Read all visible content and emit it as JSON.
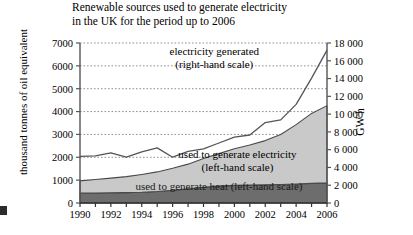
{
  "chart_data": {
    "type": "area",
    "title": "Renewable sources used to generate electricity\nin the UK for the period up to 2006",
    "xlabel": "",
    "ylabel": "thousand tonnes of oil equivalent",
    "ylabel_right": "GW h",
    "grid": true,
    "legend": "inline-annotations",
    "x": [
      1990,
      1991,
      1992,
      1993,
      1994,
      1995,
      1996,
      1997,
      1998,
      1999,
      2000,
      2001,
      2002,
      2003,
      2004,
      2005,
      2006
    ],
    "xlim": [
      1990,
      2006
    ],
    "xticks": [
      1990,
      1991,
      1992,
      1993,
      1994,
      1995,
      1996,
      1997,
      1998,
      1999,
      2000,
      2001,
      2002,
      2003,
      2004,
      2005,
      2006
    ],
    "xtick_labels": [
      "1990",
      "",
      "1992",
      "",
      "1994",
      "",
      "1996",
      "",
      "1998",
      "",
      "2000",
      "",
      "2002",
      "",
      "2004",
      "",
      "2006"
    ],
    "ylim": [
      0,
      7000
    ],
    "yticks": [
      0,
      1000,
      2000,
      3000,
      4000,
      5000,
      6000,
      7000
    ],
    "ytick_labels": [
      "0",
      "1000",
      "2000",
      "3000",
      "4000",
      "5000",
      "6000",
      "7000"
    ],
    "ylim_right": [
      0,
      18000
    ],
    "yticks_right": [
      0,
      2000,
      4000,
      6000,
      8000,
      10000,
      12000,
      14000,
      16000,
      18000
    ],
    "ytick_labels_right": [
      "0",
      "2 000",
      "4 000",
      "6 000",
      "8 000",
      "10 000",
      "12 000",
      "14 000",
      "16 000",
      "18 000"
    ],
    "series": [
      {
        "name": "used to generate heat (left-hand scale)",
        "axis": "left",
        "style": "stacked-area",
        "color": "#6d6d6d",
        "values": [
          430,
          440,
          450,
          455,
          470,
          500,
          560,
          620,
          690,
          740,
          770,
          790,
          800,
          810,
          830,
          860,
          880
        ]
      },
      {
        "name": "used to generate electricity (left-hand scale)",
        "axis": "left",
        "style": "stacked-area",
        "color": "#c9c9c9",
        "values": [
          540,
          590,
          640,
          700,
          780,
          860,
          960,
          1080,
          1260,
          1420,
          1600,
          1750,
          1930,
          2190,
          2600,
          3060,
          3380
        ]
      },
      {
        "name": "electricity generated (right-hand scale)",
        "axis": "right",
        "style": "line",
        "color": "#555555",
        "values": [
          5250,
          5300,
          5650,
          5150,
          5750,
          6200,
          5150,
          5800,
          6100,
          6750,
          7400,
          7650,
          9050,
          9350,
          11100,
          14050,
          17200
        ]
      }
    ],
    "annotations": [
      {
        "text": "electricity generated\n(right-hand scale)",
        "x": 1998.7,
        "y_right": 16600
      },
      {
        "text": "used to generate electricity\n(left-hand scale)",
        "x": 2000.2,
        "y_left": 1950
      },
      {
        "text": "used to generate heat (left-hand scale)",
        "x": 1999.0,
        "y_left": 560
      }
    ]
  },
  "labels": {
    "annotation_electricity_generated_line1": "electricity generated",
    "annotation_electricity_generated_line2": "(right-hand scale)",
    "annotation_used_electricity_line1": "used to generate electricity",
    "annotation_used_electricity_line2": "(left-hand scale)",
    "annotation_used_heat": "used to generate heat (left-hand scale)"
  }
}
